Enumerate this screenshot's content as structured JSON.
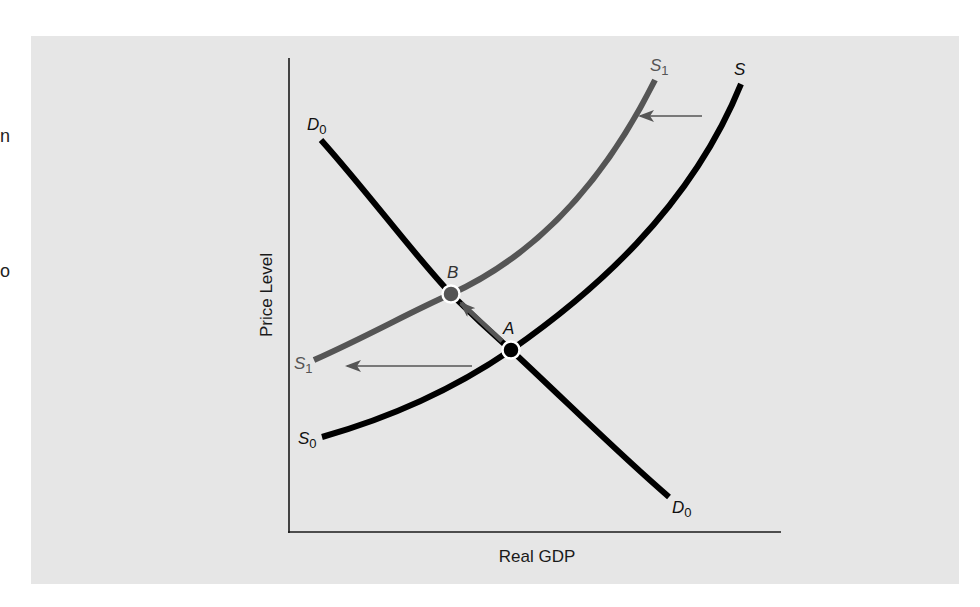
{
  "edge_fragments": [
    {
      "text": "n",
      "y": 137
    },
    {
      "text": "o",
      "y": 272
    }
  ],
  "diagram": {
    "x_axis_label": "Real GDP",
    "y_axis_label": "Price Level",
    "curves": {
      "D0": {
        "label": "D",
        "sub": "0",
        "color": "#000000"
      },
      "S0": {
        "label": "S",
        "sub": "0",
        "top_label": "S",
        "color": "#000000"
      },
      "S1": {
        "label": "S",
        "sub": "1",
        "color": "#555555"
      }
    },
    "points": {
      "A": {
        "label": "A"
      },
      "B": {
        "label": "B"
      }
    },
    "colors": {
      "background": "#e6e6e6",
      "axis": "#1a1a1a",
      "shifted_curve": "#555555",
      "arrow": "#555555"
    }
  }
}
